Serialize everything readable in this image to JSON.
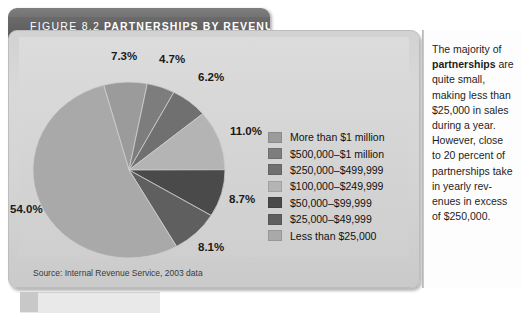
{
  "figure": {
    "number_label": "FIGURE 8.2",
    "title": "PARTNERSHIPS BY REVENUES",
    "source_note": "Source: Internal Revenue Service, 2003 data"
  },
  "chart_data": {
    "type": "pie",
    "title": "PARTNERSHIPS BY REVENUES",
    "categories": [
      "More than $1 million",
      "$500,000–$1 million",
      "$250,000–$499,999",
      "$100,000–$249,999",
      "$50,000–$99,999",
      "$25,000–$49,999",
      "Less than $25,000"
    ],
    "values": [
      7.3,
      4.7,
      6.2,
      11.0,
      8.7,
      8.1,
      54.0
    ],
    "value_labels": [
      "7.3%",
      "4.7%",
      "6.2%",
      "11.0%",
      "8.7%",
      "8.1%",
      "54.0%"
    ],
    "colors": [
      "#9b9b9b",
      "#7d7d7d",
      "#707070",
      "#b4b4b4",
      "#4a4a4a",
      "#5f5f5f",
      "#a9a9a9"
    ],
    "units": "percent",
    "legend_position": "right",
    "grid": false,
    "start_angle_deg": -15.3,
    "direction": "clockwise"
  },
  "legend": {
    "items": [
      {
        "label": "More than $1 million",
        "color": "#9b9b9b"
      },
      {
        "label": "$500,000–$1 million",
        "color": "#7d7d7d"
      },
      {
        "label": "$250,000–$499,999",
        "color": "#707070"
      },
      {
        "label": "$100,000–$249,999",
        "color": "#b4b4b4"
      },
      {
        "label": "$50,000–$99,999",
        "color": "#4a4a4a"
      },
      {
        "label": "$25,000–$49,999",
        "color": "#5f5f5f"
      },
      {
        "label": "Less than $25,000",
        "color": "#a9a9a9"
      }
    ]
  },
  "sidebar": {
    "lines": [
      {
        "text": "The majority of ",
        "bold": false
      },
      {
        "text": "partnerships",
        "bold": true
      },
      {
        "text": " are quite small, making less than $25,000 in sales during a year. However, close to 20 percent of partnerships take in yearly rev-enues in excess of $250,000.",
        "bold": false
      }
    ]
  }
}
